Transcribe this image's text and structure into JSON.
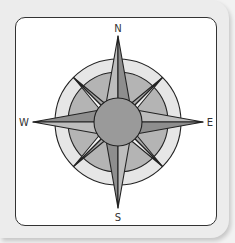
{
  "figure": {
    "type": "compass-rose",
    "labels": {
      "north": "N",
      "south": "S",
      "west": "W",
      "east": "E"
    },
    "colors": {
      "card_background": "#ececec",
      "frame_background": "#ffffff",
      "frame_border": "#333333",
      "outer_ring": "#e6e6e6",
      "inner_ring": "#b4b4b4",
      "center_disc": "#9a9a9a",
      "point_light": "#bdbdbd",
      "point_dark": "#8e8e8e",
      "diagonal_light": "#f2f2f2",
      "diagonal_dark": "#a8a8a8",
      "stroke": "#222222"
    }
  }
}
